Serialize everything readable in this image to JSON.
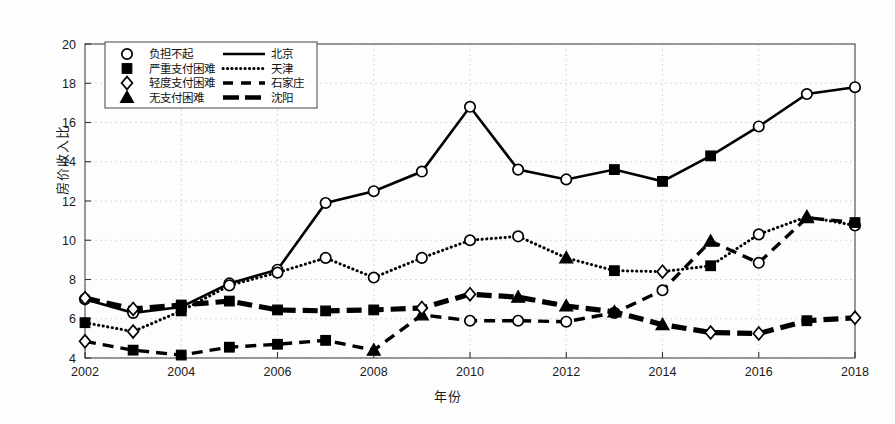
{
  "chart_data": {
    "type": "line",
    "title": "",
    "xlabel": "年份",
    "ylabel": "房价收入比",
    "x": [
      2002,
      2003,
      2004,
      2005,
      2006,
      2007,
      2008,
      2009,
      2010,
      2011,
      2012,
      2013,
      2014,
      2015,
      2016,
      2017,
      2018
    ],
    "xlim": [
      2002,
      2018
    ],
    "ylim": [
      4,
      20
    ],
    "xticks": [
      "2002",
      "2004",
      "2006",
      "2008",
      "2010",
      "2012",
      "2014",
      "2016",
      "2018"
    ],
    "yticks": [
      "4",
      "6",
      "8",
      "10",
      "12",
      "14",
      "16",
      "18",
      "20"
    ],
    "grid": true,
    "legend_position": "upper-left",
    "series": [
      {
        "name": "北京",
        "line_style": "solid",
        "values": [
          7.0,
          6.3,
          6.6,
          7.8,
          8.5,
          11.9,
          12.5,
          13.5,
          16.8,
          13.6,
          13.1,
          13.6,
          13.0,
          14.3,
          15.8,
          17.45,
          17.8
        ],
        "markers": [
          "circle",
          "circle",
          "square",
          "circle",
          "circle",
          "circle",
          "circle",
          "circle",
          "circle",
          "circle",
          "circle",
          "square",
          "square",
          "square",
          "circle",
          "circle",
          "circle"
        ]
      },
      {
        "name": "天津",
        "line_style": "dotted",
        "values": [
          5.8,
          5.35,
          6.4,
          7.7,
          8.35,
          9.1,
          8.1,
          9.1,
          10.0,
          10.2,
          9.1,
          8.45,
          8.4,
          8.7,
          10.3,
          11.2,
          10.75
        ],
        "markers": [
          "square",
          "diamond",
          "square",
          "circle",
          "circle",
          "circle",
          "circle",
          "circle",
          "circle",
          "circle",
          "triangle",
          "square",
          "diamond",
          "square",
          "circle",
          "triangle",
          "circle"
        ]
      },
      {
        "name": "石家庄",
        "line_style": "dashed",
        "values": [
          4.85,
          4.4,
          4.15,
          4.55,
          4.7,
          4.9,
          4.4,
          6.2,
          5.9,
          5.9,
          5.85,
          6.3,
          7.45,
          9.95,
          8.85,
          11.15,
          10.9
        ],
        "markers": [
          "diamond",
          "square",
          "square",
          "square",
          "square",
          "square",
          "triangle",
          "triangle",
          "circle",
          "circle",
          "circle",
          "circle",
          "circle",
          "triangle",
          "circle",
          "triangle",
          "square"
        ]
      },
      {
        "name": "沈阳",
        "line_style": "thick-dashed",
        "values": [
          7.05,
          6.5,
          6.7,
          6.9,
          6.45,
          6.4,
          6.45,
          6.55,
          7.25,
          7.1,
          6.65,
          6.35,
          5.7,
          5.3,
          5.25,
          5.9,
          6.05
        ],
        "markers": [
          "diamond",
          "diamond",
          "square",
          "square",
          "square",
          "square",
          "square",
          "diamond",
          "diamond",
          "triangle",
          "triangle",
          "triangle",
          "triangle",
          "diamond",
          "diamond",
          "square",
          "diamond"
        ]
      }
    ],
    "legend_markers": [
      {
        "symbol": "circle",
        "label": "负担不起"
      },
      {
        "symbol": "square",
        "label": "严重支付困难"
      },
      {
        "symbol": "diamond",
        "label": "轻度支付困难"
      },
      {
        "symbol": "triangle",
        "label": "无支付困难"
      }
    ],
    "legend_lines": [
      {
        "style": "solid",
        "label": "北京"
      },
      {
        "style": "dotted",
        "label": "天津"
      },
      {
        "style": "dashed",
        "label": "石家庄"
      },
      {
        "style": "thick-dashed",
        "label": "沈阳"
      }
    ]
  }
}
